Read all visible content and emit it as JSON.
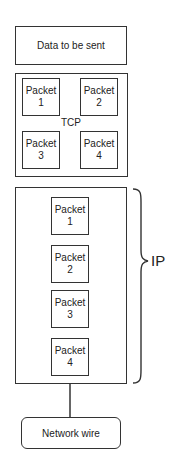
{
  "diagram": {
    "data_box": {
      "label": "Data to be sent"
    },
    "tcp": {
      "label": "TCP",
      "packets": [
        {
          "word": "Packet",
          "number": "1"
        },
        {
          "word": "Packet",
          "number": "2"
        },
        {
          "word": "Packet",
          "number": "3"
        },
        {
          "word": "Packet",
          "number": "4"
        }
      ]
    },
    "ip": {
      "label": "IP",
      "packets": [
        {
          "word": "Packet",
          "number": "1"
        },
        {
          "word": "Packet",
          "number": "2"
        },
        {
          "word": "Packet",
          "number": "3"
        },
        {
          "word": "Packet",
          "number": "4"
        }
      ]
    },
    "network_wire": {
      "label": "Network wire"
    },
    "colors": {
      "stroke": "#333333",
      "text": "#222222",
      "background": "#ffffff"
    }
  }
}
